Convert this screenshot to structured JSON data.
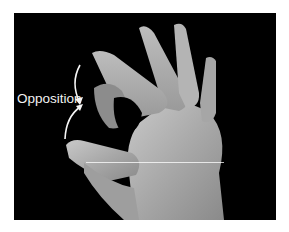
{
  "figure": {
    "annotation_label": "Opposition",
    "arrows": [
      "down-arrow from index fingertip",
      "up-arrow from thumb tip"
    ],
    "colors": {
      "background": "#000000",
      "frame": "#ffffff",
      "text": "#f2f2f2"
    }
  }
}
